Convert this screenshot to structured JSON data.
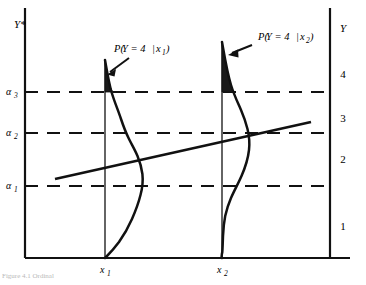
{
  "figure": {
    "type": "diagram",
    "left_axis": {
      "label": "Y*",
      "thresholds": [
        {
          "id": "alpha3",
          "label_base": "α",
          "label_sub": "3",
          "y": 92
        },
        {
          "id": "alpha2",
          "label_base": "α",
          "label_sub": "2",
          "y": 133
        },
        {
          "id": "alpha1",
          "label_base": "α",
          "label_sub": "1",
          "y": 186
        }
      ]
    },
    "right_axis": {
      "label": "Y",
      "categories": [
        {
          "label": "4",
          "y": 74
        },
        {
          "label": "3",
          "y": 118
        },
        {
          "label": "2",
          "y": 159
        },
        {
          "label": "1",
          "y": 226
        }
      ]
    },
    "x_axis": {
      "points": [
        {
          "id": "x1",
          "base": "x",
          "sub": "1",
          "x": 105
        },
        {
          "id": "x2",
          "base": "x",
          "sub": "2",
          "x": 222
        }
      ]
    },
    "annotations": [
      {
        "id": "prob-x1",
        "text_parts": {
          "p": "P(",
          "expr": "Y = 4",
          "bar": "|",
          "cond_base": "x",
          "cond_sub": "1",
          "close": ")"
        },
        "full_text": "P(Y = 4|x1)",
        "x": 114,
        "y": 50,
        "arrow_from": [
          118,
          60
        ],
        "arrow_to": [
          104,
          74
        ]
      },
      {
        "id": "prob-x2",
        "text_parts": {
          "p": "P(",
          "expr": "Y = 4",
          "bar": "|",
          "cond_base": "x",
          "cond_sub": "2",
          "close": ")"
        },
        "full_text": "P(Y = 4|x2)",
        "x": 243,
        "y": 36,
        "arrow_from": [
          240,
          45
        ],
        "arrow_to": [
          222,
          55
        ]
      }
    ],
    "regression_line": {
      "x1": 55,
      "y1": 179,
      "x2": 311,
      "y2": 122
    },
    "distributions": [
      {
        "id": "dist-x1",
        "at_x": 105,
        "peak_y": 60,
        "mode_y": 170,
        "shaded_above": 92
      },
      {
        "id": "dist-x2",
        "at_x": 222,
        "peak_y": 42,
        "mode_y": 133,
        "shaded_above": 92
      }
    ],
    "frame": {
      "left": 25,
      "right": 350,
      "top": 8,
      "bottom": 258
    },
    "colors": {
      "ink": "#111111",
      "background": "#ffffff",
      "shade_fill": "#1a1a1a",
      "caption": "#b9b9b9"
    }
  },
  "caption": {
    "text": "Figure 4.1   Ordinal"
  }
}
